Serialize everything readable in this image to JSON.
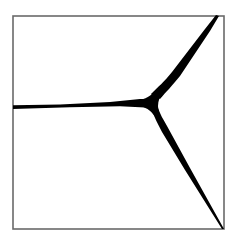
{
  "figure": {
    "frame": {
      "x": 13,
      "y": 16,
      "width": 211,
      "height": 213,
      "stroke": "#6a6a6a",
      "stroke_width": 1.6
    },
    "junction": {
      "x": 152,
      "y": 103,
      "fill": "#000000"
    },
    "arms": [
      {
        "name": "left-arm",
        "end": {
          "x": 13,
          "y": 107
        }
      },
      {
        "name": "upper-right-arm",
        "end": {
          "x": 218,
          "y": 16
        }
      },
      {
        "name": "lower-right-arm",
        "end": {
          "x": 224,
          "y": 229
        }
      }
    ],
    "background": "#ffffff"
  }
}
